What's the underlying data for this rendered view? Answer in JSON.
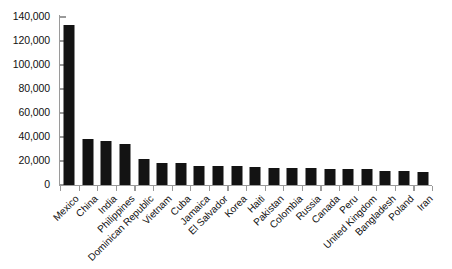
{
  "chart_data": {
    "type": "bar",
    "title": "",
    "subtitle": "",
    "xlabel": "",
    "ylabel": "",
    "ylim": [
      0,
      140000
    ],
    "ytick_step": 20000,
    "grid": false,
    "legend": null,
    "orientation": "vertical",
    "bar_color": "#131313",
    "axis_color": "#9a9a9a",
    "categories": [
      "Mexico",
      "China",
      "India",
      "Philippines",
      "Dominican Republic",
      "Vietnam",
      "Cuba",
      "Jamaica",
      "El Salvador",
      "Korea",
      "Haiti",
      "Pakistan",
      "Colombia",
      "Russia",
      "Canada",
      "Peru",
      "United Kingdom",
      "Bangladesh",
      "Poland",
      "Iran"
    ],
    "values": [
      133000,
      38000,
      37000,
      34500,
      21500,
      18000,
      18000,
      16000,
      16000,
      15500,
      15000,
      14500,
      14000,
      14000,
      13500,
      13500,
      13000,
      12000,
      11500,
      10500
    ],
    "ytick_labels": [
      "0",
      "20,000",
      "40,000",
      "60,000",
      "80,000",
      "100,000",
      "120,000",
      "140,000"
    ],
    "ytick_values": [
      0,
      20000,
      40000,
      60000,
      80000,
      100000,
      120000,
      140000
    ]
  }
}
